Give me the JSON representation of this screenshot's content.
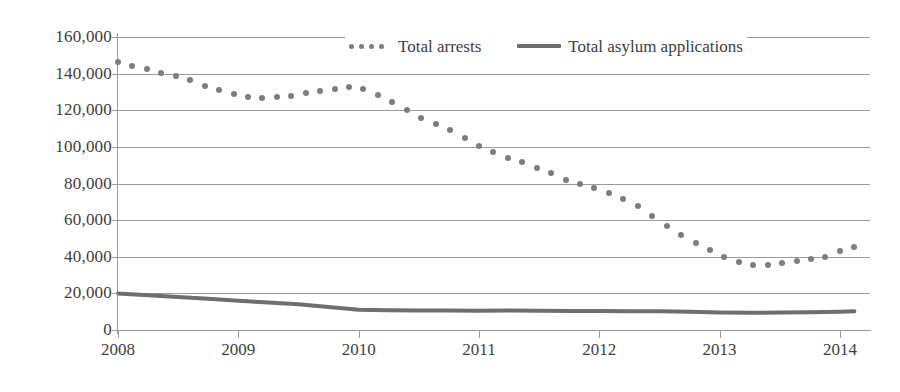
{
  "chart_data": {
    "type": "line",
    "title": "",
    "xlabel": "",
    "ylabel": "",
    "grid": true,
    "legend_position": "top-center",
    "ylim": [
      0,
      160000
    ],
    "xlim": [
      2008,
      2014.25
    ],
    "y_ticks": [
      {
        "value": 160000,
        "label": "160,000"
      },
      {
        "value": 140000,
        "label": "140,000"
      },
      {
        "value": 120000,
        "label": "120,000"
      },
      {
        "value": 100000,
        "label": "100,000"
      },
      {
        "value": 80000,
        "label": "80,000"
      },
      {
        "value": 60000,
        "label": "60,000"
      },
      {
        "value": 40000,
        "label": "40,000"
      },
      {
        "value": 20000,
        "label": "20,000"
      },
      {
        "value": 0,
        "label": "0"
      }
    ],
    "x_ticks": [
      {
        "value": 2008,
        "label": "2008"
      },
      {
        "value": 2009,
        "label": "2009"
      },
      {
        "value": 2010,
        "label": "2010"
      },
      {
        "value": 2011,
        "label": "2011"
      },
      {
        "value": 2012,
        "label": "2012"
      },
      {
        "value": 2013,
        "label": "2013"
      },
      {
        "value": 2014,
        "label": "2014"
      }
    ],
    "series": [
      {
        "name": "Total arrests",
        "style": "dotted",
        "color": "#7d7d7d",
        "x": [
          2008.0,
          2008.12,
          2008.24,
          2008.36,
          2008.48,
          2008.6,
          2008.72,
          2008.84,
          2008.96,
          2009.08,
          2009.2,
          2009.32,
          2009.44,
          2009.56,
          2009.68,
          2009.8,
          2009.92,
          2010.04,
          2010.16,
          2010.28,
          2010.4,
          2010.52,
          2010.64,
          2010.76,
          2010.88,
          2011.0,
          2011.12,
          2011.24,
          2011.36,
          2011.48,
          2011.6,
          2011.72,
          2011.84,
          2011.96,
          2012.08,
          2012.2,
          2012.32,
          2012.44,
          2012.56,
          2012.68,
          2012.8,
          2012.92,
          2013.04,
          2013.16,
          2013.28,
          2013.4,
          2013.52,
          2013.64,
          2013.76,
          2013.88,
          2014.0,
          2014.12
        ],
        "values": [
          146500,
          144000,
          142500,
          140500,
          138500,
          136500,
          133000,
          131000,
          129000,
          127000,
          126500,
          127000,
          128000,
          129500,
          130500,
          131500,
          132500,
          131500,
          128500,
          124500,
          120000,
          116000,
          112500,
          109000,
          105000,
          100500,
          97000,
          94000,
          91500,
          88500,
          85500,
          82000,
          79500,
          77500,
          75000,
          71500,
          67500,
          62500,
          57000,
          52000,
          47500,
          43500,
          40000,
          37000,
          35500,
          35500,
          36500,
          37500,
          38500,
          40000,
          43000,
          45500
        ]
      },
      {
        "name": "Total asylum applications",
        "style": "solid",
        "color": "#6e6e6e",
        "x": [
          2008.0,
          2008.25,
          2008.5,
          2008.75,
          2009.0,
          2009.25,
          2009.5,
          2009.75,
          2010.0,
          2010.25,
          2010.5,
          2010.75,
          2011.0,
          2011.25,
          2011.5,
          2011.75,
          2012.0,
          2012.25,
          2012.5,
          2012.75,
          2013.0,
          2013.25,
          2013.5,
          2013.75,
          2014.0,
          2014.12
        ],
        "values": [
          20000,
          19000,
          18000,
          17000,
          16000,
          15000,
          14000,
          12500,
          11000,
          10800,
          10700,
          10600,
          10500,
          10600,
          10500,
          10400,
          10400,
          10300,
          10200,
          10000,
          9600,
          9400,
          9500,
          9700,
          10000,
          10200
        ]
      }
    ]
  },
  "legend": {
    "entries": [
      {
        "label": "Total arrests",
        "marker": "dotted-marker"
      },
      {
        "label": "Total asylum applications",
        "marker": "solid-line-marker"
      }
    ]
  }
}
